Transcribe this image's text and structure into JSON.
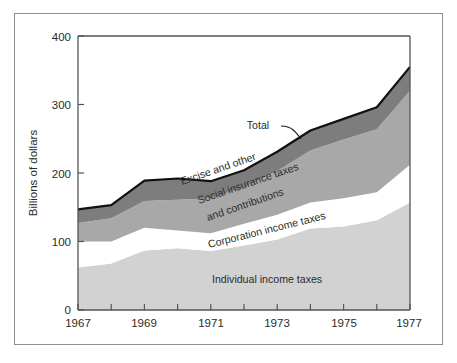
{
  "figure": {
    "background_color": "#ffffff",
    "frame_color": "#8d8d8d"
  },
  "chart_data": {
    "type": "area",
    "stacked": true,
    "title": "",
    "subtitle": "",
    "xlabel": "",
    "ylabel": "Billions of dollars",
    "xlim": [
      1967,
      1977
    ],
    "ylim": [
      0,
      400
    ],
    "ytick_values": [
      0,
      100,
      200,
      300,
      400
    ],
    "ytick_labels": [
      "0",
      "100",
      "200",
      "300",
      "400"
    ],
    "xtick_values": [
      1967,
      1968,
      1969,
      1970,
      1971,
      1972,
      1973,
      1974,
      1975,
      1976,
      1977
    ],
    "xtick_labels": [
      "1967",
      "",
      "1969",
      "",
      "1971",
      "",
      "1973",
      "",
      "1975",
      "",
      "1977"
    ],
    "xtick_labels_shown": [
      "1967",
      "1969",
      "1971",
      "1973",
      "1975",
      "1977"
    ],
    "grid": false,
    "legend": "inline-annotations",
    "x": [
      1967,
      1968,
      1969,
      1970,
      1971,
      1972,
      1973,
      1974,
      1975,
      1976,
      1977
    ],
    "series": [
      {
        "name": "Individual income taxes",
        "color": "#d2d2d2",
        "values": [
          62,
          68,
          87,
          90,
          86,
          94,
          103,
          119,
          122,
          131,
          157
        ]
      },
      {
        "name": "Corporation income taxes",
        "color": "#ffffff",
        "values": [
          38,
          32,
          33,
          26,
          26,
          32,
          36,
          38,
          41,
          41,
          55
        ]
      },
      {
        "name": "Social insurance taxes and contributions",
        "color": "#a8a8a8",
        "values": [
          27,
          34,
          39,
          45,
          51,
          53,
          64,
          76,
          86,
          92,
          108
        ]
      },
      {
        "name": "Excise and other",
        "color": "#7d7d7d",
        "values": [
          20,
          19,
          30,
          31,
          25,
          25,
          28,
          29,
          30,
          32,
          35
        ]
      }
    ],
    "totals": [
      147,
      153,
      189,
      192,
      188,
      204,
      231,
      262,
      279,
      296,
      355
    ],
    "annotations": [
      {
        "label": "Total",
        "x": 1972.0,
        "y": 268,
        "rotation": 0
      },
      {
        "label": "Excise and other",
        "x": 1969.6,
        "y": 176,
        "rotation": -18
      },
      {
        "label": "Social insurance taxes",
        "x": 1970.3,
        "y": 157,
        "rotation": -18
      },
      {
        "label": "and contributions",
        "x": 1970.8,
        "y": 141,
        "rotation": -18
      },
      {
        "label": "Corporation income taxes",
        "x": 1971.2,
        "y": 110,
        "rotation": -13
      },
      {
        "label": "Individual income taxes",
        "x": 1971.8,
        "y": 42,
        "rotation": 0
      }
    ]
  },
  "axis": {
    "y_title": "Billions of dollars",
    "y_labels": [
      "400",
      "300",
      "200",
      "100",
      "0"
    ],
    "x_labels": [
      "1967",
      "1969",
      "1971",
      "1973",
      "1975",
      "1977"
    ]
  },
  "labels": {
    "total": "Total",
    "excise": "Excise and other",
    "social_line1": "Social insurance taxes",
    "social_line2": "and contributions",
    "corporation": "Corporation income taxes",
    "individual": "Individual income taxes"
  }
}
